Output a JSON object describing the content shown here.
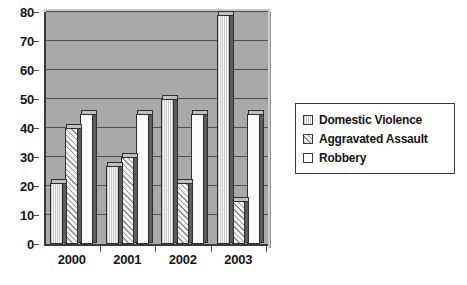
{
  "chart_data": {
    "type": "bar",
    "title": "",
    "subtitle": "",
    "xlabel": "",
    "ylabel": "",
    "categories": [
      "2000",
      "2001",
      "2002",
      "2003"
    ],
    "series": [
      {
        "name": "Domestic Violence",
        "values": [
          21,
          27,
          50,
          79
        ],
        "pattern": "vertical-lines",
        "swatch": "fill-dv"
      },
      {
        "name": "Aggravated Assault",
        "values": [
          40,
          30,
          21,
          15
        ],
        "pattern": "diagonal-hatch",
        "swatch": "fill-aa"
      },
      {
        "name": "Robbery",
        "values": [
          45,
          45,
          45,
          45
        ],
        "pattern": "solid-white",
        "swatch": "fill-rb"
      }
    ],
    "ylim": [
      0,
      80
    ],
    "yticks": [
      0,
      10,
      20,
      30,
      40,
      50,
      60,
      70,
      80
    ],
    "ytick_labels": [
      "0",
      "10",
      "20",
      "30",
      "40",
      "50",
      "60",
      "70",
      "80"
    ],
    "grid": true,
    "grid_axis": "y",
    "legend_position": "right",
    "plot_background": "#a9a9a9",
    "figure_background": "#ffffff",
    "bar_style": "3d",
    "colors": {
      "plot_bg": "#a9a9a9",
      "gridline": "#4f4f4f",
      "axis": "#3a3a3a",
      "text": "#151515",
      "bar_outline": "#2e2e2e",
      "bar_side": "#5c5c5c",
      "bar_cap": "#bfbfbf"
    }
  },
  "legend": {
    "items": [
      {
        "label": "Domestic Violence"
      },
      {
        "label": "Aggravated Assault"
      },
      {
        "label": "Robbery"
      }
    ]
  }
}
